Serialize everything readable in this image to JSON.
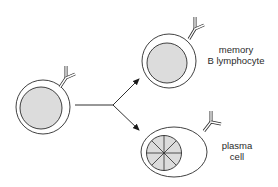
{
  "diagram": {
    "type": "B cell differentiation",
    "colors": {
      "stroke": "#2b2b2b",
      "nucleus_fill": "#dcdcdc",
      "background": "#ffffff"
    },
    "nodes": [
      {
        "id": "activated-b-cell",
        "label": "",
        "shape": "round cell with nucleus and surface antibody"
      },
      {
        "id": "memory-b-lymphocyte",
        "label_lines": [
          "memory",
          "B lymphocyte"
        ]
      },
      {
        "id": "plasma-cell",
        "label_lines": [
          "plasma",
          "cell"
        ]
      }
    ],
    "edges": [
      {
        "from": "activated-b-cell",
        "to": "memory-b-lymphocyte",
        "style": "arrow"
      },
      {
        "from": "activated-b-cell",
        "to": "plasma-cell",
        "style": "arrow"
      }
    ]
  },
  "labels": {
    "memory": {
      "line1": "memory",
      "line2": "B lymphocyte"
    },
    "plasma": {
      "line1": "plasma",
      "line2": "cell"
    }
  }
}
